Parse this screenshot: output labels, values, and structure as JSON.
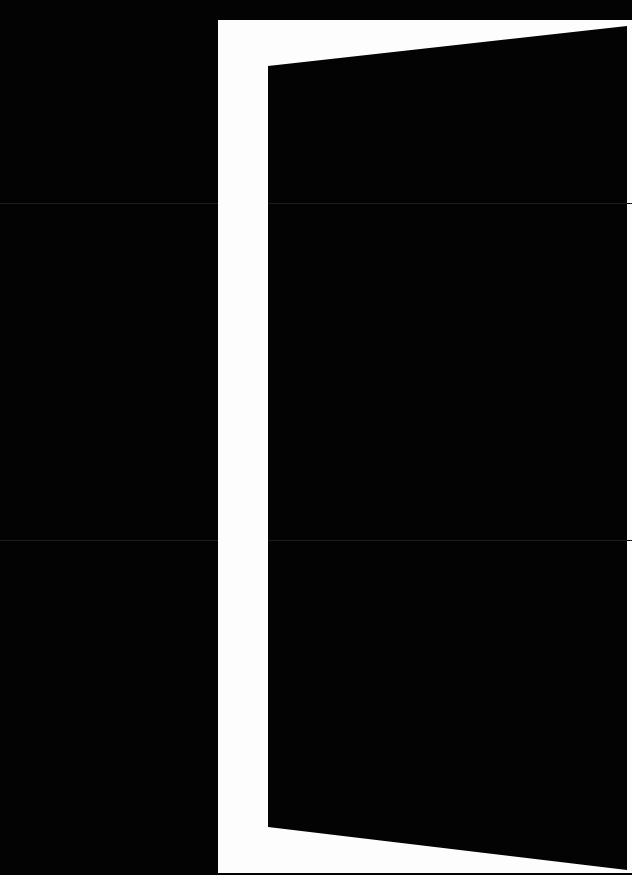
{
  "image": {
    "subject": "open-door-silhouette",
    "caption": "Open door",
    "colors": {
      "background": "#030303",
      "door_frame": "#fdfdfd",
      "door_panel": "#030303",
      "fold_line": "#1c1c1c"
    }
  }
}
